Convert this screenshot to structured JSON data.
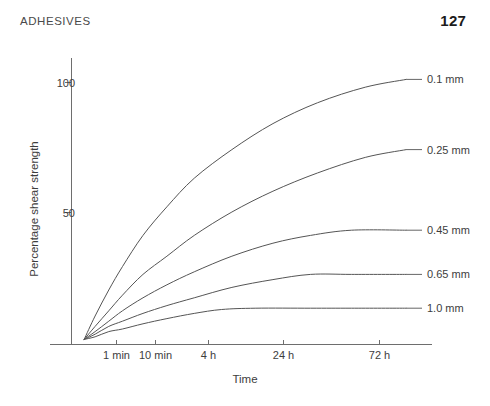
{
  "header": {
    "running_head": "ADHESIVES",
    "page_number": "127"
  },
  "chart_data": {
    "type": "line",
    "title": "",
    "xlabel": "Time",
    "ylabel": "Percentage shear strength",
    "x_tick_labels": [
      "1 min",
      "10 min",
      "4 h",
      "24 h",
      "72 h"
    ],
    "y_tick_labels": [
      "50",
      "100"
    ],
    "y_ticks": [
      50,
      100
    ],
    "ylim": [
      0,
      112
    ],
    "grid": false,
    "legend_position": "right-inline-labels",
    "x_positions": [
      0.11,
      0.225,
      0.38,
      0.6,
      0.88
    ],
    "series": [
      {
        "name": "0.1 mm",
        "label": "0.1 mm",
        "color": "#555555",
        "label_y_percent": 101,
        "points": [
          [
            0.018,
            1
          ],
          [
            0.05,
            10
          ],
          [
            0.09,
            20
          ],
          [
            0.13,
            29
          ],
          [
            0.19,
            41
          ],
          [
            0.26,
            52
          ],
          [
            0.34,
            63
          ],
          [
            0.45,
            74
          ],
          [
            0.57,
            84
          ],
          [
            0.7,
            92
          ],
          [
            0.84,
            98
          ],
          [
            0.96,
            101
          ]
        ]
      },
      {
        "name": "0.25 mm",
        "label": "0.25 mm",
        "color": "#555555",
        "label_y_percent": 74,
        "points": [
          [
            0.018,
            1
          ],
          [
            0.05,
            6
          ],
          [
            0.09,
            12
          ],
          [
            0.13,
            18
          ],
          [
            0.19,
            26
          ],
          [
            0.26,
            33
          ],
          [
            0.34,
            41
          ],
          [
            0.45,
            50
          ],
          [
            0.57,
            58
          ],
          [
            0.7,
            65
          ],
          [
            0.84,
            71
          ],
          [
            0.96,
            74
          ]
        ]
      },
      {
        "name": "0.45 mm",
        "label": "0.45 mm",
        "color": "#555555",
        "label_y_percent": 43,
        "points": [
          [
            0.018,
            1
          ],
          [
            0.05,
            4
          ],
          [
            0.09,
            8
          ],
          [
            0.13,
            12
          ],
          [
            0.19,
            17
          ],
          [
            0.26,
            22
          ],
          [
            0.34,
            27
          ],
          [
            0.45,
            33
          ],
          [
            0.57,
            38
          ],
          [
            0.68,
            41
          ],
          [
            0.8,
            43
          ],
          [
            0.96,
            43
          ]
        ]
      },
      {
        "name": "0.65 mm",
        "label": "0.65 mm",
        "color": "#555555",
        "label_y_percent": 26,
        "points": [
          [
            0.018,
            1
          ],
          [
            0.05,
            3
          ],
          [
            0.09,
            6
          ],
          [
            0.13,
            8
          ],
          [
            0.19,
            11
          ],
          [
            0.26,
            14
          ],
          [
            0.34,
            17
          ],
          [
            0.45,
            21
          ],
          [
            0.57,
            24
          ],
          [
            0.68,
            26
          ],
          [
            0.8,
            26
          ],
          [
            0.96,
            26
          ]
        ]
      },
      {
        "name": "1.0 mm",
        "label": "1.0 mm",
        "color": "#555555",
        "label_y_percent": 13,
        "points": [
          [
            0.018,
            1
          ],
          [
            0.05,
            2
          ],
          [
            0.09,
            4
          ],
          [
            0.13,
            5
          ],
          [
            0.19,
            7
          ],
          [
            0.26,
            9
          ],
          [
            0.34,
            11
          ],
          [
            0.42,
            12.5
          ],
          [
            0.52,
            13
          ],
          [
            0.68,
            13
          ],
          [
            0.8,
            13
          ],
          [
            0.96,
            13
          ]
        ]
      }
    ]
  }
}
